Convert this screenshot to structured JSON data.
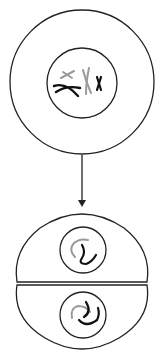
{
  "diagram": {
    "type": "cell-division",
    "stages": [
      {
        "name": "parent-cell",
        "chromosomes": [
          "gray-x-small",
          "black-x-large",
          "gray-x-tall",
          "black-x-small"
        ]
      },
      {
        "name": "daughter-cells",
        "count": 2,
        "chromosomes_each": [
          "gray-strand",
          "black-strand"
        ]
      }
    ],
    "arrow": {
      "direction": "down"
    },
    "colors": {
      "stroke": "#222222",
      "gray": "#9a9a9a",
      "background": "#ffffff"
    }
  }
}
